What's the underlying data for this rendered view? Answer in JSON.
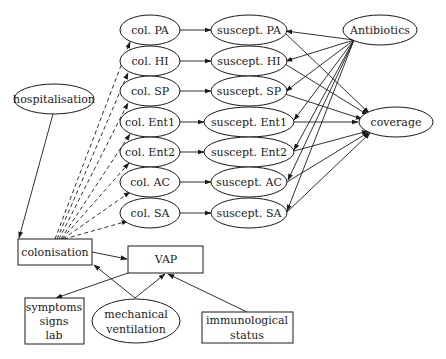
{
  "diagram": {
    "type": "causal-network",
    "nodes": {
      "col_pa": "col. PA",
      "col_hi": "col. HI",
      "col_sp": "col. SP",
      "col_ent1": "col. Ent1",
      "col_ent2": "col. Ent2",
      "col_ac": "col. AC",
      "col_sa": "col. SA",
      "sus_pa": "suscept. PA",
      "sus_hi": "suscept. HI",
      "sus_sp": "suscept. SP",
      "sus_ent1": "suscept. Ent1",
      "sus_ent2": "suscept. Ent2",
      "sus_ac": "suscept. AC",
      "sus_sa": "suscept. SA",
      "antibiotics": "Antibiotics",
      "coverage": "coverage",
      "hospitalisation": "hospitalisation",
      "colonisation": "colonisation",
      "vap": "VAP",
      "symptoms_1": "symptoms",
      "symptoms_2": "signs",
      "symptoms_3": "lab",
      "mechvent_1": "mechanical",
      "mechvent_2": "ventilation",
      "immuno_1": "immunological",
      "immuno_2": "status"
    },
    "edges": [
      {
        "from": "colonisation",
        "to": "col. PA",
        "style": "dashed"
      },
      {
        "from": "colonisation",
        "to": "col. HI",
        "style": "dashed"
      },
      {
        "from": "colonisation",
        "to": "col. SP",
        "style": "dashed"
      },
      {
        "from": "colonisation",
        "to": "col. Ent1",
        "style": "dashed"
      },
      {
        "from": "colonisation",
        "to": "col. Ent2",
        "style": "dashed"
      },
      {
        "from": "colonisation",
        "to": "col. AC",
        "style": "dashed"
      },
      {
        "from": "colonisation",
        "to": "col. SA",
        "style": "dashed"
      },
      {
        "from": "col. PA",
        "to": "suscept. PA",
        "style": "solid"
      },
      {
        "from": "col. HI",
        "to": "suscept. HI",
        "style": "solid"
      },
      {
        "from": "col. SP",
        "to": "suscept. SP",
        "style": "solid"
      },
      {
        "from": "col. Ent1",
        "to": "suscept. Ent1",
        "style": "solid"
      },
      {
        "from": "col. Ent2",
        "to": "suscept. Ent2",
        "style": "solid"
      },
      {
        "from": "col. AC",
        "to": "suscept. AC",
        "style": "solid"
      },
      {
        "from": "col. SA",
        "to": "suscept. SA",
        "style": "solid"
      },
      {
        "from": "Antibiotics",
        "to": "suscept. PA",
        "style": "solid"
      },
      {
        "from": "Antibiotics",
        "to": "suscept. HI",
        "style": "solid"
      },
      {
        "from": "Antibiotics",
        "to": "suscept. SP",
        "style": "solid"
      },
      {
        "from": "Antibiotics",
        "to": "suscept. Ent1",
        "style": "solid"
      },
      {
        "from": "Antibiotics",
        "to": "suscept. Ent2",
        "style": "solid"
      },
      {
        "from": "Antibiotics",
        "to": "suscept. AC",
        "style": "solid"
      },
      {
        "from": "Antibiotics",
        "to": "suscept. SA",
        "style": "solid"
      },
      {
        "from": "suscept. PA",
        "to": "coverage",
        "style": "solid"
      },
      {
        "from": "suscept. HI",
        "to": "coverage",
        "style": "solid"
      },
      {
        "from": "suscept. SP",
        "to": "coverage",
        "style": "solid"
      },
      {
        "from": "suscept. Ent1",
        "to": "coverage",
        "style": "solid"
      },
      {
        "from": "suscept. Ent2",
        "to": "coverage",
        "style": "solid"
      },
      {
        "from": "suscept. AC",
        "to": "coverage",
        "style": "solid"
      },
      {
        "from": "suscept. SA",
        "to": "coverage",
        "style": "solid"
      },
      {
        "from": "hospitalisation",
        "to": "colonisation",
        "style": "solid"
      },
      {
        "from": "colonisation",
        "to": "VAP",
        "style": "solid"
      },
      {
        "from": "mechanical ventilation",
        "to": "colonisation",
        "style": "solid"
      },
      {
        "from": "mechanical ventilation",
        "to": "VAP",
        "style": "solid"
      },
      {
        "from": "immunological status",
        "to": "VAP",
        "style": "solid"
      },
      {
        "from": "VAP",
        "to": "symptoms signs lab",
        "style": "solid"
      }
    ]
  }
}
